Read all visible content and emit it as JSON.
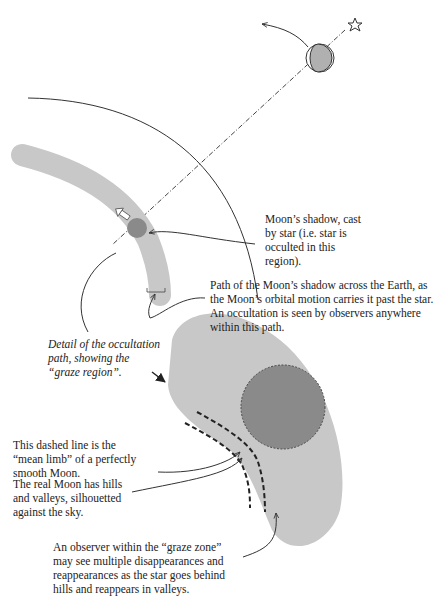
{
  "figure": {
    "colors": {
      "background": "#ffffff",
      "path_fill": "#c8c8c8",
      "shadow_fill": "#8a8a8a",
      "moon_lit": "#bdbdbd",
      "line": "#333333"
    },
    "elements": {
      "star_icon": "star-outline",
      "moon_icon": "moon-crescent",
      "direction_arrow": "white-arrow"
    }
  },
  "labels": {
    "moon_shadow": "Moon’s shadow, cast by star (i.e. star is occulted in this region).",
    "shadow_path": "Path of the Moon’s shadow across the Earth, as the Moon’s orbital motion carries it past the star.  An occultation is seen by observers anywhere within this path.",
    "detail": "Detail of the occultation path, showing the “graze region”.",
    "mean_limb": "This dashed line is the “mean limb” of a perfectly smooth Moon.",
    "real_moon": "The real Moon has hills and valleys, silhouetted against the sky.",
    "graze_zone": "An observer within the “graze zone” may see multiple disappearances and reappearances as the star goes behind hills and reappears in valleys."
  }
}
